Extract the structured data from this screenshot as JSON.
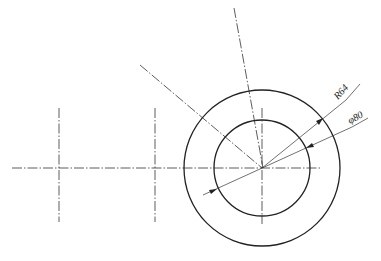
{
  "drawing": {
    "dimensions": [
      {
        "label": "R64",
        "type": "radius"
      },
      {
        "label": "φ80",
        "type": "diameter"
      }
    ]
  }
}
